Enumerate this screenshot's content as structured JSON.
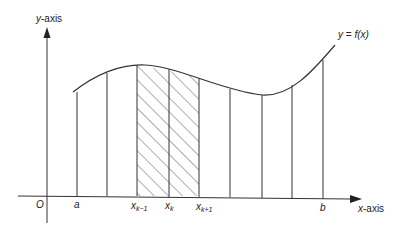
{
  "figure": {
    "type": "riemann-sum-diagram",
    "axes": {
      "x_label_var": "x",
      "x_label_rest": "-axis",
      "y_label_var": "y",
      "y_label_rest": "-axis",
      "origin_label": "O"
    },
    "curve_label": {
      "lhs": "y",
      "eq": " = ",
      "rhs": "f(x)"
    },
    "points": [
      {
        "id": "a",
        "base": "a",
        "sub": ""
      },
      {
        "id": "xk-1",
        "base": "x",
        "sub": "k−1"
      },
      {
        "id": "xk",
        "base": "x",
        "sub": "k"
      },
      {
        "id": "xk+1",
        "base": "x",
        "sub": "k+1"
      },
      {
        "id": "b",
        "base": "b",
        "sub": ""
      }
    ],
    "shaded_interval": [
      "x_{k-1}",
      "x_{k+1}"
    ],
    "partition_count": 8,
    "colors": {
      "stroke": "#333333",
      "background": "#ffffff"
    }
  }
}
